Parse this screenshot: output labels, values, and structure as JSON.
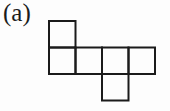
{
  "figure": {
    "label": "(a)",
    "background_color": "#fdfdfd",
    "line_color": "#1b1b1b",
    "line_width": 2,
    "grid": {
      "origin_x": 49,
      "origin_y": 21,
      "cell_size": 26.5,
      "cells": [
        {
          "col": 0,
          "row": 0
        },
        {
          "col": 0,
          "row": 1
        },
        {
          "col": 1,
          "row": 1
        },
        {
          "col": 2,
          "row": 1
        },
        {
          "col": 3,
          "row": 1
        },
        {
          "col": 2,
          "row": 2
        }
      ]
    }
  }
}
